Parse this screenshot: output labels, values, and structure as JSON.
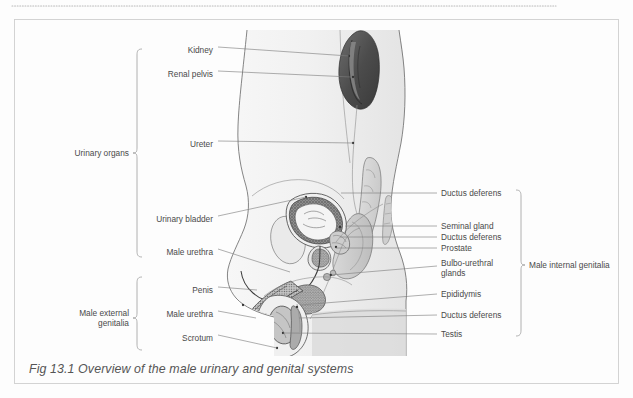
{
  "page": {
    "background_color": "#fdfdfd",
    "border_color": "#cfcfcf",
    "dotted_rule_color": "#b9b9b9"
  },
  "figure": {
    "caption": "Fig 13.1 Overview of the male urinary and genital systems",
    "caption_color": "#555555",
    "illustration_name": "male-urogenital-sagittal-section"
  },
  "labels": {
    "left": [
      {
        "text": "Kidney",
        "x": 213,
        "y": 50
      },
      {
        "text": "Renal pelvis",
        "x": 213,
        "y": 74
      },
      {
        "text": "Ureter",
        "x": 213,
        "y": 144
      },
      {
        "text": "Urinary bladder",
        "x": 213,
        "y": 219
      },
      {
        "text": "Male urethra",
        "x": 213,
        "y": 252
      },
      {
        "text": "Penis",
        "x": 213,
        "y": 290
      },
      {
        "text": "Male urethra",
        "x": 213,
        "y": 314
      },
      {
        "text": "Scrotum",
        "x": 213,
        "y": 338
      }
    ],
    "right": [
      {
        "text": "Ductus deferens",
        "x": 441,
        "y": 196
      },
      {
        "text": "Seminal gland",
        "x": 441,
        "y": 229
      },
      {
        "text": "Ductus deferens",
        "x": 441,
        "y": 240
      },
      {
        "text": "Prostate",
        "x": 441,
        "y": 251
      },
      {
        "text": "Bulbo-urethral",
        "x": 441,
        "y": 266
      },
      {
        "text": "glands",
        "x": 441,
        "y": 275
      },
      {
        "text": "Epididymis",
        "x": 441,
        "y": 297
      },
      {
        "text": "Ductus deferens",
        "x": 441,
        "y": 318
      },
      {
        "text": "Testis",
        "x": 441,
        "y": 337
      }
    ],
    "groups": [
      {
        "text": "Urinary organs",
        "x": 129,
        "y": 153
      },
      {
        "text": "Male external",
        "x": 129,
        "y": 313
      },
      {
        "text": "genitalia",
        "x": 129,
        "y": 323
      },
      {
        "text": "Male internal genitalia",
        "x": 527,
        "y": 265
      }
    ]
  }
}
